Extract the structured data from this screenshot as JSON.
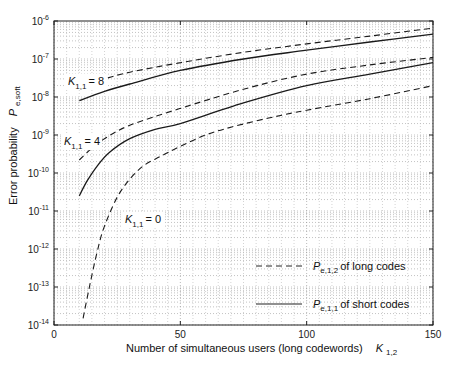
{
  "chart_data": {
    "type": "line",
    "title": "",
    "xlabel": "Number of simultaneous users (long codewords)",
    "xlabel_symbol": "K",
    "xlabel_symbol_sub": "1,2",
    "ylabel": "Error probability",
    "ylabel_symbol": "P",
    "ylabel_symbol_sub": "e,soft",
    "xlim": [
      0,
      150
    ],
    "ylim": [
      1e-14,
      1e-06
    ],
    "yscale": "log",
    "grid": true,
    "x_ticks": [
      0,
      50,
      100,
      150
    ],
    "y_ticks": [
      {
        "base": "10",
        "exp": "-6"
      },
      {
        "base": "10",
        "exp": "-7"
      },
      {
        "base": "10",
        "exp": "-8"
      },
      {
        "base": "10",
        "exp": "-9"
      },
      {
        "base": "10",
        "exp": "-10"
      },
      {
        "base": "10",
        "exp": "-11"
      },
      {
        "base": "10",
        "exp": "-12"
      },
      {
        "base": "10",
        "exp": "-13"
      },
      {
        "base": "10",
        "exp": "-14"
      }
    ],
    "legend": {
      "position": "lower right",
      "entries": [
        {
          "style": "dashed",
          "symbol": "P",
          "sub": "e,1,2",
          "text": "of long codes"
        },
        {
          "style": "solid",
          "symbol": "P",
          "sub": "e,1,1",
          "text": "of short codes"
        }
      ]
    },
    "annotations": [
      {
        "symbol": "K",
        "sub": "1,1",
        "text": "= 8",
        "x": 68,
        "y": 85
      },
      {
        "symbol": "K",
        "sub": "1,1",
        "text": "= 4",
        "x": 64,
        "y": 145
      },
      {
        "symbol": "K",
        "sub": "1,1",
        "text": "= 0",
        "x": 125,
        "y": 223
      }
    ],
    "series": [
      {
        "name": "K11=8 long codes (Pe,1,2)",
        "style": "dashed",
        "x": [
          10,
          20,
          30,
          50,
          75,
          100,
          125,
          150
        ],
        "y": [
          1.8e-08,
          3e-08,
          4.5e-08,
          8e-08,
          1.5e-07,
          2.5e-07,
          4e-07,
          6.5e-07
        ]
      },
      {
        "name": "K11=8 short codes (Pe,1,1)",
        "style": "solid",
        "x": [
          10,
          20,
          30,
          50,
          75,
          100,
          125,
          150
        ],
        "y": [
          8e-09,
          1.4e-08,
          2.2e-08,
          5e-08,
          1e-07,
          1.7e-07,
          2.8e-07,
          4.5e-07
        ]
      },
      {
        "name": "K11=4 long codes (Pe,1,2)",
        "style": "dashed",
        "x": [
          10,
          15,
          20,
          30,
          50,
          75,
          100,
          125,
          150
        ],
        "y": [
          2.2e-10,
          4.5e-10,
          8e-10,
          1.8e-09,
          5e-09,
          1.6e-08,
          4e-08,
          7e-08,
          1.1e-07
        ]
      },
      {
        "name": "K11=4 short codes (Pe,1,1)",
        "style": "solid",
        "x": [
          10,
          13,
          17,
          22,
          30,
          40,
          50,
          75,
          100,
          125,
          150
        ],
        "y": [
          2.5e-11,
          6e-11,
          1.5e-10,
          3.5e-10,
          8e-10,
          1.4e-09,
          2e-09,
          7e-09,
          2e-08,
          4e-08,
          8e-08
        ]
      },
      {
        "name": "K11=0 long codes (Pe,1,2)",
        "style": "dashed",
        "x": [
          11.5,
          14,
          17,
          20,
          26,
          34,
          42,
          50,
          60,
          70,
          85,
          100,
          125,
          150
        ],
        "y": [
          1.5e-14,
          1e-13,
          8e-13,
          4e-12,
          3e-11,
          1.3e-10,
          2.7e-10,
          5e-10,
          1e-09,
          1.6e-09,
          2.8e-09,
          4.5e-09,
          9e-09,
          2e-08
        ]
      }
    ]
  }
}
